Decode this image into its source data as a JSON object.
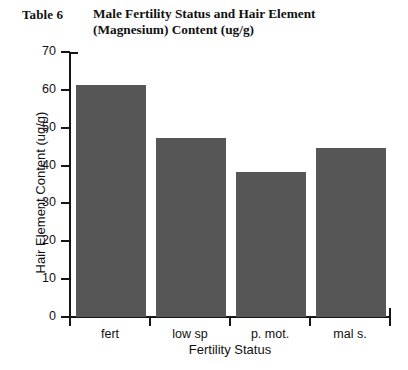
{
  "caption": {
    "label": "Table 6",
    "title_line1": "Male Fertility Status and Hair Element",
    "title_line2": "(Magnesium) Content (ug/g)"
  },
  "colors": {
    "bar_fill": "#565656",
    "axis": "#151515",
    "background": "#ffffff",
    "text": "#111111"
  },
  "chart_data": {
    "type": "bar",
    "title": "Male Fertility Status and Hair Element (Magnesium) Content (ug/g)",
    "categories": [
      "fert",
      "low sp",
      "p. mot.",
      "mal s."
    ],
    "values": [
      61.2,
      47.2,
      38.2,
      44.7
    ],
    "series": [
      {
        "name": "Hair Element Content (ug/g)",
        "values": [
          61.2,
          47.2,
          38.2,
          44.7
        ]
      }
    ],
    "xlabel": "Fertility Status",
    "ylabel": "Hair Element Content (ug/g)",
    "ylim": [
      0,
      70
    ],
    "yticks": [
      0,
      10,
      20,
      30,
      40,
      50,
      60,
      70
    ],
    "ytick_labels": [
      "0",
      "10",
      "20",
      "30",
      "40",
      "50",
      "60",
      "70"
    ],
    "grid": false,
    "legend": false,
    "bar_color": "#565656"
  }
}
